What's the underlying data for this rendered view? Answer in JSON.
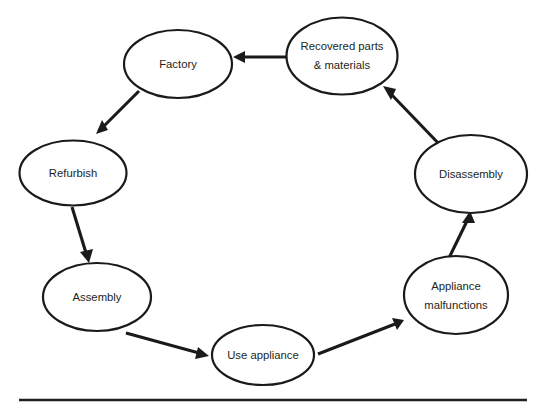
{
  "diagram": {
    "type": "cycle-flow",
    "background_color": "#ffffff",
    "line_color": "#1a1a1a",
    "text_color": "#231f20",
    "nodes": [
      {
        "id": "recovered-parts",
        "label": "Recovered parts & materials",
        "label_lines": [
          "Recovered parts",
          "& materials"
        ],
        "cx": 342,
        "cy": 56,
        "rx": 55.5,
        "ry": 38.5
      },
      {
        "id": "factory",
        "label": "Factory",
        "label_lines": [
          "Factory"
        ],
        "cx": 178,
        "cy": 64,
        "rx": 54,
        "ry": 34
      },
      {
        "id": "refurbish",
        "label": "Refurbish",
        "label_lines": [
          "Refurbish"
        ],
        "cx": 73,
        "cy": 173,
        "rx": 53.5,
        "ry": 32.5
      },
      {
        "id": "assembly",
        "label": "Assembly",
        "label_lines": [
          "Assembly"
        ],
        "cx": 97,
        "cy": 297,
        "rx": 54,
        "ry": 34
      },
      {
        "id": "use-appliance",
        "label": "Use appliance",
        "label_lines": [
          "Use appliance"
        ],
        "cx": 263,
        "cy": 355,
        "rx": 51,
        "ry": 30
      },
      {
        "id": "appliance-malfunctions",
        "label": "Appliance malfunctions",
        "label_lines": [
          "Appliance",
          "malfunctions"
        ],
        "cx": 456,
        "cy": 295,
        "rx": 52,
        "ry": 39
      },
      {
        "id": "disassembly",
        "label": "Disassembly",
        "label_lines": [
          "Disassembly"
        ],
        "cx": 471,
        "cy": 174,
        "rx": 56,
        "ry": 39
      }
    ],
    "edges": [
      {
        "id": "edge-recovered-to-factory",
        "from": "recovered-parts",
        "to": "factory",
        "x1": 288,
        "y1": 57,
        "x2": 234,
        "y2": 57
      },
      {
        "id": "edge-factory-to-refurbish",
        "from": "factory",
        "to": "refurbish",
        "x1": 139,
        "y1": 91,
        "x2": 96,
        "y2": 134
      },
      {
        "id": "edge-refurbish-to-assembly",
        "from": "refurbish",
        "to": "assembly",
        "x1": 72,
        "y1": 207,
        "x2": 89,
        "y2": 262
      },
      {
        "id": "edge-assembly-to-use",
        "from": "assembly",
        "to": "use-appliance",
        "x1": 126,
        "y1": 333,
        "x2": 209,
        "y2": 356
      },
      {
        "id": "edge-use-to-malfunctions",
        "from": "use-appliance",
        "to": "appliance-malfunctions",
        "x1": 318,
        "y1": 354,
        "x2": 404,
        "y2": 320
      },
      {
        "id": "edge-malfunctions-to-disassembly",
        "from": "appliance-malfunctions",
        "to": "disassembly",
        "x1": 447,
        "y1": 262,
        "x2": 470,
        "y2": 211
      },
      {
        "id": "edge-disassembly-to-recovered",
        "from": "disassembly",
        "to": "recovered-parts",
        "x1": 441,
        "y1": 146,
        "x2": 383,
        "y2": 86
      }
    ],
    "baseline_rule": {
      "x1": 19,
      "y1": 400,
      "x2": 527,
      "y2": 400
    }
  }
}
